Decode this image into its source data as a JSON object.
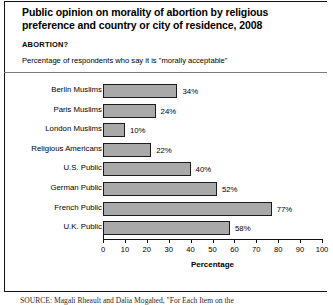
{
  "figure": {
    "title": "Public opinion on morality of abortion by religious preference and country or city of residence, 2008",
    "kicker": "ABORTION?",
    "subtitle": "Percentage of respondents who say it is \"morally acceptable\"",
    "source": "SOURCE: Magali Rheault and Dalia Mogahed, \"For Each Item on the"
  },
  "chart_data": {
    "type": "bar",
    "orientation": "horizontal",
    "title": "Public opinion on morality of abortion by religious preference and country or city of residence, 2008",
    "subtitle": "Percentage of respondents who say it is \"morally acceptable\"",
    "xlabel": "Percentage",
    "ylabel": "",
    "xlim": [
      0,
      100
    ],
    "xticks": [
      0,
      10,
      20,
      30,
      40,
      50,
      60,
      70,
      80,
      90,
      100
    ],
    "grid": false,
    "legend": false,
    "bar_color": "#a9a9a9",
    "bar_border_color": "#1c1c1c",
    "categories": [
      "Berlin Muslims",
      "Paris Muslims",
      "London Muslims",
      "Religious Americans",
      "U.S. Public",
      "German Public",
      "French Public",
      "U.K. Public"
    ],
    "values": [
      34,
      24,
      10,
      22,
      40,
      52,
      77,
      58
    ],
    "value_labels": [
      "34%",
      "24%",
      "10%",
      "22%",
      "40%",
      "52%",
      "77%",
      "58%"
    ]
  }
}
